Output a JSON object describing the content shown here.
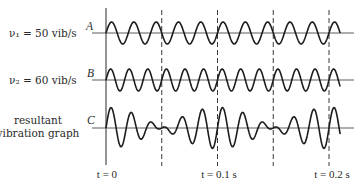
{
  "labels": {
    "nu1": "ν₁ = 50 vib/s",
    "nu2": "ν₂ = 60 vib/s",
    "resultant_line1": "resultant",
    "resultant_line2": "vibration graph",
    "graph_a": "A",
    "graph_b": "B",
    "graph_c": "C"
  },
  "time_labels": {
    "t0": "t = 0",
    "t1": "t = 0.1 s",
    "t2": "t = 0.2 s"
  },
  "chart_data": {
    "type": "line",
    "title": "",
    "xlabel": "t",
    "ylabel": "",
    "x_ticks": [
      {
        "t": 0,
        "label": "t = 0"
      },
      {
        "t": 0.1,
        "label": "t = 0.1 s"
      },
      {
        "t": 0.2,
        "label": "t = 0.2 s"
      }
    ],
    "dashed_gridlines_t": [
      0.05,
      0.1,
      0.15,
      0.2
    ],
    "t_range": [
      0,
      0.21
    ],
    "series": [
      {
        "name": "A",
        "label": "ν₁ = 50 vib/s",
        "components_hz": [
          50
        ]
      },
      {
        "name": "B",
        "label": "ν₂ = 60 vib/s",
        "components_hz": [
          60
        ]
      },
      {
        "name": "C",
        "label": "resultant vibration graph",
        "components_hz": [
          50,
          60
        ]
      }
    ],
    "colors": {
      "line": "#1c1c1c",
      "text": "#2a2a2a"
    }
  }
}
